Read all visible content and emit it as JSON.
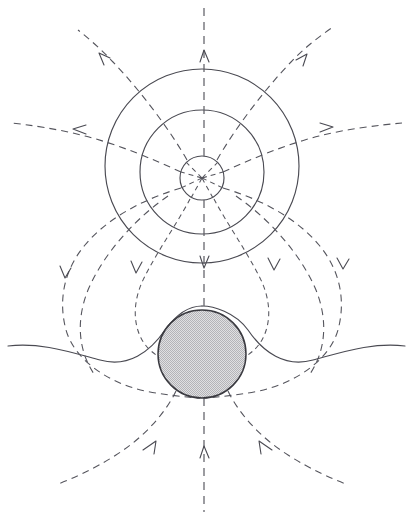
{
  "figure": {
    "caption": "",
    "width": 413,
    "height": 517,
    "background_color": "#ffffff"
  },
  "colors": {
    "solid_stroke": "#4a4a52",
    "dashed_stroke": "#55555d",
    "sphere_fill": "#cfcfd2",
    "sphere_stroke": "#3a3a40",
    "background": "#ffffff"
  },
  "elements": {
    "dipole_center": {
      "label": "dipole-center",
      "cx": 202,
      "cy": 178,
      "r": 22,
      "style": "solid"
    },
    "outer_flux_circle": {
      "label": "outer-flux-circle",
      "cx": 202,
      "cy": 166,
      "r": 97,
      "style": "solid"
    },
    "inner_flux_circle": {
      "label": "inner-flux-circle",
      "cx": 202,
      "cy": 172,
      "r": 62,
      "style": "solid"
    },
    "shaded_sphere": {
      "label": "shaded-sphere",
      "cx": 202,
      "cy": 354,
      "r": 44,
      "fill": "stippled-gray"
    },
    "tangent_wave": {
      "label": "tangent-wave-curve",
      "style": "solid",
      "description": "wave passing tangentially over the top of the sphere, extending to both page edges"
    }
  },
  "field_lines": {
    "style": "dashed",
    "count": 9,
    "description": "Dipole field lines radiating from the small central circle, curving outward and down around the shaded sphere.",
    "arrows": [
      {
        "name": "arrow-top-center",
        "direction": "up",
        "x": 205,
        "y": 52
      },
      {
        "name": "arrow-top-left",
        "direction": "up-left",
        "x": 103,
        "y": 57
      },
      {
        "name": "arrow-top-right",
        "direction": "up-right",
        "x": 303,
        "y": 57
      },
      {
        "name": "arrow-mid-left",
        "direction": "left",
        "x": 78,
        "y": 130
      },
      {
        "name": "arrow-mid-right",
        "direction": "right",
        "x": 328,
        "y": 128
      },
      {
        "name": "arrow-lower-center",
        "direction": "down",
        "x": 204,
        "y": 266
      },
      {
        "name": "arrow-lower-left",
        "direction": "down",
        "x": 136,
        "y": 272
      },
      {
        "name": "arrow-lower-right",
        "direction": "down",
        "x": 274,
        "y": 268
      },
      {
        "name": "arrow-far-left",
        "direction": "down",
        "x": 64,
        "y": 277
      },
      {
        "name": "arrow-far-right",
        "direction": "down",
        "x": 343,
        "y": 266
      },
      {
        "name": "arrow-bottom-center",
        "direction": "up",
        "x": 205,
        "y": 447
      },
      {
        "name": "arrow-bottom-left",
        "direction": "up-right",
        "x": 152,
        "y": 443
      },
      {
        "name": "arrow-bottom-right",
        "direction": "up-left",
        "x": 265,
        "y": 443
      }
    ]
  },
  "axis": {
    "name": "vertical-dipole-axis",
    "style": "dashed",
    "x": 204,
    "y_top": 8,
    "y_bottom": 512
  }
}
